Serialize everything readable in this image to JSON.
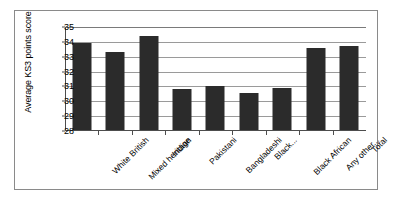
{
  "chart_data": {
    "type": "bar",
    "title": "",
    "subtitle": "",
    "xlabel": "",
    "ylabel": "Average KS3 points score",
    "ylim": [
      28,
      35
    ],
    "ytick_labels": [
      "35",
      "34",
      "33",
      "32",
      "31",
      "30",
      "29",
      "28"
    ],
    "yticks": [
      35,
      34,
      33,
      32,
      31,
      30,
      29,
      28
    ],
    "grid": true,
    "legend": false,
    "legend_position": "none",
    "bar_color": "#2b2b2b",
    "categories": [
      "White British",
      "Mixed heritage",
      "Indian",
      "Pakistani",
      "Bangladeshi",
      "Black...",
      "Black African",
      "Any other...",
      "Total"
    ],
    "values": [
      33.9,
      33.35,
      34.4,
      30.8,
      31.0,
      30.55,
      30.9,
      33.6,
      33.7
    ]
  }
}
